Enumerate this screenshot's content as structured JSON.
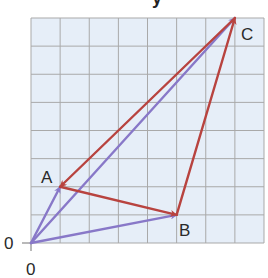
{
  "diagram": {
    "title_fragment": "y",
    "grid": {
      "cols": 8,
      "rows": 8,
      "fill": "#e6eef8",
      "line_color": "#a9a9a9"
    },
    "origin": {
      "label_x": "0",
      "label_y": "0"
    },
    "points": [
      {
        "name": "O",
        "label": "",
        "x": 0,
        "y": 0
      },
      {
        "name": "A",
        "label": "A",
        "x": 1,
        "y": 2
      },
      {
        "name": "B",
        "label": "B",
        "x": 5,
        "y": 1
      },
      {
        "name": "C",
        "label": "C",
        "x": 7,
        "y": 8
      }
    ],
    "vectors": [
      {
        "from": "O",
        "to": "A",
        "color": "#8878c8",
        "series": "position"
      },
      {
        "from": "O",
        "to": "B",
        "color": "#8878c8",
        "series": "position"
      },
      {
        "from": "O",
        "to": "C",
        "color": "#8878c8",
        "series": "position"
      },
      {
        "from": "A",
        "to": "B",
        "color": "#b8433f",
        "series": "triangle"
      },
      {
        "from": "B",
        "to": "C",
        "color": "#b8433f",
        "series": "triangle"
      },
      {
        "from": "C",
        "to": "A",
        "color": "#b8433f",
        "series": "triangle"
      }
    ],
    "colors": {
      "position_vectors": "#8878c8",
      "triangle_vectors": "#b8433f"
    }
  }
}
